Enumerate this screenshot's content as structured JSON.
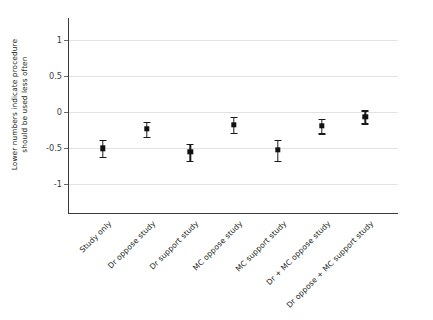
{
  "chart_data": {
    "type": "scatter",
    "title": "",
    "subtitle": "",
    "xlabel": "",
    "ylabel": "Lower numbers indicate procedure should be used less often",
    "ylabel_line1": "Lower numbers indicate procedure",
    "ylabel_line2": "should be used less often",
    "ylim": [
      -1.35,
      1.3
    ],
    "yticks": [
      1,
      0.5,
      0,
      -0.5,
      -1
    ],
    "ytick_labels": [
      "1",
      "0.5",
      "0",
      "-0.5",
      "-1"
    ],
    "grid": true,
    "legend": "none",
    "error_bar_style": "capped",
    "marker_color": "#111111",
    "grid_color": "#e2e2e2",
    "axis_color": "#3a3a3a",
    "categories": [
      "Study only",
      "Dr oppose study",
      "Dr support study",
      "MC oppose study",
      "MC support study",
      "Dr + MC oppose study",
      "Dr oppose + MC support study"
    ],
    "values": [
      -0.51,
      -0.24,
      -0.56,
      -0.18,
      -0.53,
      -0.2,
      -0.07
    ],
    "error_low": [
      -0.63,
      -0.35,
      -0.68,
      -0.29,
      -0.68,
      -0.3,
      -0.16
    ],
    "error_high": [
      -0.39,
      -0.14,
      -0.45,
      -0.07,
      -0.39,
      -0.1,
      0.02
    ],
    "points": [
      {
        "category": "Study only",
        "value": -0.51,
        "low": -0.63,
        "high": -0.39
      },
      {
        "category": "Dr oppose study",
        "value": -0.24,
        "low": -0.35,
        "high": -0.14
      },
      {
        "category": "Dr support study",
        "value": -0.56,
        "low": -0.68,
        "high": -0.45
      },
      {
        "category": "MC oppose study",
        "value": -0.18,
        "low": -0.29,
        "high": -0.07
      },
      {
        "category": "MC support study",
        "value": -0.53,
        "low": -0.68,
        "high": -0.39
      },
      {
        "category": "Dr + MC oppose study",
        "value": -0.2,
        "low": -0.3,
        "high": -0.1
      },
      {
        "category": "Dr oppose + MC support study",
        "value": -0.07,
        "low": -0.16,
        "high": 0.02
      }
    ]
  }
}
